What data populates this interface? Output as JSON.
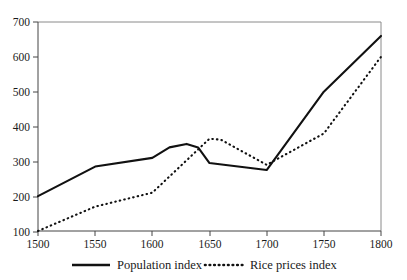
{
  "chart_data": {
    "type": "line",
    "title": "",
    "subtitle": "",
    "xlabel": "",
    "ylabel": "",
    "xlim": [
      1500,
      1800
    ],
    "ylim": [
      100,
      700
    ],
    "grid": false,
    "legend_position": "bottom",
    "xticks": [
      "1500",
      "1550",
      "1600",
      "1650",
      "1700",
      "1750",
      "1800"
    ],
    "xtick_values": [
      1500,
      1550,
      1600,
      1650,
      1700,
      1750,
      1800
    ],
    "yticks": [
      "100",
      "200",
      "300",
      "400",
      "500",
      "600",
      "700"
    ],
    "ytick_values": [
      100,
      200,
      300,
      400,
      500,
      600,
      700
    ],
    "series": [
      {
        "name": "Population index",
        "style": "solid",
        "color": "#111111",
        "x": [
          1500,
          1550,
          1600,
          1615,
          1630,
          1640,
          1650,
          1700,
          1750,
          1800
        ],
        "values": [
          200,
          285,
          310,
          340,
          350,
          340,
          295,
          275,
          500,
          660
        ]
      },
      {
        "name": "Rice prices index",
        "style": "dotted",
        "color": "#111111",
        "x": [
          1500,
          1550,
          1600,
          1650,
          1660,
          1700,
          1750,
          1800
        ],
        "values": [
          100,
          170,
          210,
          365,
          362,
          290,
          380,
          600
        ]
      }
    ],
    "annotations": []
  },
  "legend": {
    "items": [
      {
        "label": "Population index",
        "style": "solid"
      },
      {
        "label": "Rice prices index",
        "style": "dotted"
      }
    ]
  }
}
